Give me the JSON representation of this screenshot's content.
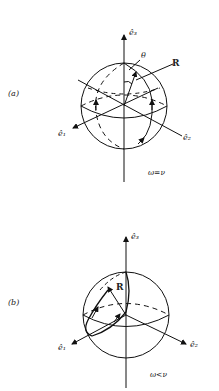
{
  "figure": {
    "panels": [
      {
        "id": "a",
        "label": "(a)",
        "axes": {
          "e1": "ê₁",
          "e2": "ê₂",
          "e3": "ê₃"
        },
        "vector_label": "R",
        "angle_label": "θ",
        "condition": "ω=ν"
      },
      {
        "id": "b",
        "label": "(b)",
        "axes": {
          "e1": "ê₁",
          "e2": "ê₂",
          "e3": "ê₃"
        },
        "vector_label": "R",
        "condition": "ω<ν"
      }
    ]
  }
}
